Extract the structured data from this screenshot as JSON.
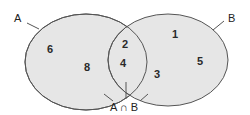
{
  "diagram": {
    "type": "venn",
    "sets": [
      {
        "name": "A",
        "label": "A",
        "elements_only": [
          "6",
          "8"
        ]
      },
      {
        "name": "B",
        "label": "B",
        "elements_only": [
          "1",
          "5",
          "3"
        ]
      }
    ],
    "intersection": {
      "label": "A ∩ B",
      "elements": [
        "2",
        "4"
      ]
    },
    "numbers": {
      "a1": "6",
      "a2": "8",
      "ab1": "2",
      "ab2": "4",
      "b1": "1",
      "b2": "5",
      "b3": "3"
    },
    "colors": {
      "fill": "#e6e6e6",
      "stroke": "#555555",
      "text": "#222222"
    }
  }
}
